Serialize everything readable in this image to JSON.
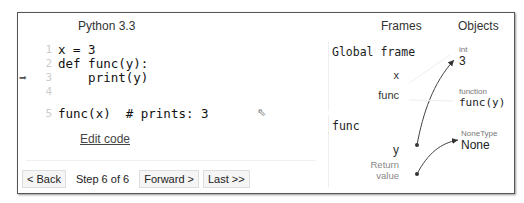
{
  "header": {
    "language": "Python 3.3"
  },
  "code": {
    "lines": [
      {
        "no": "1",
        "text": "x = 3"
      },
      {
        "no": "2",
        "text": "def func(y):"
      },
      {
        "no": "3",
        "text": "    print(y)"
      },
      {
        "no": "4",
        "text": ""
      },
      {
        "no": "5",
        "text": "func(x)  # prints: 3"
      }
    ],
    "current_line": 3,
    "edit_link": "Edit code"
  },
  "nav": {
    "back": "< Back",
    "step": "Step 6 of 6",
    "forward": "Forward >",
    "last": "Last >>"
  },
  "vis": {
    "frames_header": "Frames",
    "objects_header": "Objects",
    "global_frame": {
      "title": "Global frame",
      "vars": [
        "x",
        "func"
      ]
    },
    "func_frame": {
      "title": "func",
      "vars": [
        "y"
      ],
      "return_label": "Return value"
    },
    "objects": [
      {
        "type": "int",
        "value": "3"
      },
      {
        "type": "function",
        "value": "func(y)"
      },
      {
        "type": "NoneType",
        "value": "None"
      }
    ]
  }
}
